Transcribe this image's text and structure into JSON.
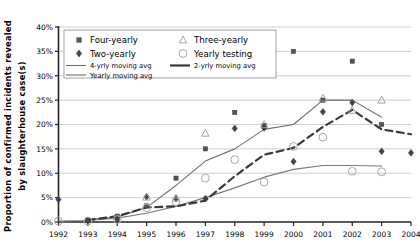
{
  "chart_data": {
    "type": "line",
    "title": "",
    "xlabel": "",
    "ylabel": "Proportion of confirmed incidents revealed by slaughterhouse case(s)",
    "ylabel_line1": "Proportion  of  confirmed  incidents  revealed",
    "ylabel_line2": "by  slaughterhouse  case(s)",
    "x": [
      1992,
      1993,
      1994,
      1995,
      1996,
      1997,
      1998,
      1999,
      2000,
      2001,
      2002,
      2003,
      2004
    ],
    "xticklabels": [
      "1992",
      "1993",
      "1994",
      "1995",
      "1996",
      "1997",
      "1998",
      "1999",
      "2000",
      "2001",
      "2002",
      "2003",
      "2004"
    ],
    "yticklabels": [
      "0%",
      "5%",
      "10%",
      "15%",
      "20%",
      "25%",
      "30%",
      "35%",
      "40%"
    ],
    "yticks": [
      0,
      5,
      10,
      15,
      20,
      25,
      30,
      35,
      40
    ],
    "ylim": [
      0,
      40
    ],
    "xlim": [
      1992,
      2004
    ],
    "grid": true,
    "grid_axis": "y",
    "legend_position": "top-left-inside",
    "series": [
      {
        "name": "Four-yearly",
        "key": "four_yearly",
        "marker": "square",
        "style": "markers",
        "color": "#555555",
        "points": [
          {
            "x": 1993,
            "y": 0.4
          },
          {
            "x": 1994,
            "y": 1.2
          },
          {
            "x": 1995,
            "y": 3.3
          },
          {
            "x": 1996,
            "y": 9.0
          },
          {
            "x": 1997,
            "y": 15.0
          },
          {
            "x": 1998,
            "y": 22.5
          },
          {
            "x": 1999,
            "y": 19.8
          },
          {
            "x": 2000,
            "y": 35.0
          },
          {
            "x": 2001,
            "y": 25.0
          },
          {
            "x": 2002,
            "y": 33.0
          },
          {
            "x": 2003,
            "y": 20.0
          }
        ]
      },
      {
        "name": "Two-yearly",
        "key": "two_yearly",
        "marker": "diamond",
        "style": "markers",
        "color": "#444444",
        "points": [
          {
            "x": 1992,
            "y": 4.6
          },
          {
            "x": 1993,
            "y": 0.3
          },
          {
            "x": 1994,
            "y": 0.5
          },
          {
            "x": 1995,
            "y": 5.2
          },
          {
            "x": 1996,
            "y": 4.8
          },
          {
            "x": 1997,
            "y": 4.8
          },
          {
            "x": 1998,
            "y": 19.2
          },
          {
            "x": 1999,
            "y": 19.3
          },
          {
            "x": 2000,
            "y": 12.4
          },
          {
            "x": 2001,
            "y": 22.6
          },
          {
            "x": 2002,
            "y": 24.5
          },
          {
            "x": 2003,
            "y": 14.5
          },
          {
            "x": 2004,
            "y": 14.2
          }
        ]
      },
      {
        "name": "Three-yearly",
        "key": "three_yearly",
        "marker": "triangle",
        "style": "markers",
        "color": "#9a9a9a",
        "points": [
          {
            "x": 1995,
            "y": 5.1
          },
          {
            "x": 1996,
            "y": 4.9
          },
          {
            "x": 1997,
            "y": 18.2
          },
          {
            "x": 1999,
            "y": 20.0
          },
          {
            "x": 2001,
            "y": 25.4
          },
          {
            "x": 2002,
            "y": 22.9
          },
          {
            "x": 2003,
            "y": 25.0
          }
        ]
      },
      {
        "name": "Yearly testing",
        "key": "yearly_testing",
        "marker": "circle",
        "style": "markers",
        "color": "#a8a8a8",
        "points": [
          {
            "x": 1992,
            "y": 0.2
          },
          {
            "x": 1993,
            "y": 0.2
          },
          {
            "x": 1994,
            "y": 0.5
          },
          {
            "x": 1995,
            "y": 2.9
          },
          {
            "x": 1996,
            "y": 4.2
          },
          {
            "x": 1997,
            "y": 9.0
          },
          {
            "x": 1998,
            "y": 12.8
          },
          {
            "x": 1999,
            "y": 8.2
          },
          {
            "x": 2000,
            "y": 15.5
          },
          {
            "x": 2001,
            "y": 17.4
          },
          {
            "x": 2002,
            "y": 10.4
          },
          {
            "x": 2003,
            "y": 10.3
          }
        ]
      },
      {
        "name": "4-yrly moving avg",
        "key": "ma4",
        "style": "line",
        "linestyle": "solid",
        "width": 1.1,
        "color": "#6e6e6e",
        "points": [
          {
            "x": 1993,
            "y": 0.5
          },
          {
            "x": 1994,
            "y": 1.0
          },
          {
            "x": 1995,
            "y": 3.0
          },
          {
            "x": 1996,
            "y": 7.5
          },
          {
            "x": 1997,
            "y": 12.5
          },
          {
            "x": 1998,
            "y": 15.0
          },
          {
            "x": 1999,
            "y": 19.0
          },
          {
            "x": 2000,
            "y": 20.0
          },
          {
            "x": 2001,
            "y": 25.0
          },
          {
            "x": 2002,
            "y": 25.0
          },
          {
            "x": 2003,
            "y": 21.5
          }
        ]
      },
      {
        "name": "Yearly moving avg",
        "key": "ma1",
        "style": "line",
        "linestyle": "solid",
        "width": 1.1,
        "color": "#7a7a7a",
        "points": [
          {
            "x": 1992,
            "y": 0.2
          },
          {
            "x": 1993,
            "y": 0.3
          },
          {
            "x": 1994,
            "y": 0.8
          },
          {
            "x": 1995,
            "y": 1.8
          },
          {
            "x": 1996,
            "y": 3.2
          },
          {
            "x": 1997,
            "y": 5.0
          },
          {
            "x": 1998,
            "y": 7.0
          },
          {
            "x": 1999,
            "y": 9.2
          },
          {
            "x": 2000,
            "y": 10.8
          },
          {
            "x": 2001,
            "y": 11.6
          },
          {
            "x": 2002,
            "y": 11.6
          },
          {
            "x": 2003,
            "y": 11.5
          }
        ]
      },
      {
        "name": "2-yrly moving avg",
        "key": "ma2",
        "style": "line",
        "linestyle": "dashed",
        "width": 2.2,
        "color": "#3a3a3a",
        "points": [
          {
            "x": 1993,
            "y": 0.4
          },
          {
            "x": 1994,
            "y": 1.2
          },
          {
            "x": 1995,
            "y": 3.0
          },
          {
            "x": 1996,
            "y": 3.2
          },
          {
            "x": 1997,
            "y": 4.4
          },
          {
            "x": 1998,
            "y": 9.4
          },
          {
            "x": 1999,
            "y": 13.8
          },
          {
            "x": 2000,
            "y": 15.2
          },
          {
            "x": 2001,
            "y": 19.5
          },
          {
            "x": 2002,
            "y": 23.0
          },
          {
            "x": 2003,
            "y": 19.0
          },
          {
            "x": 2004,
            "y": 18.0
          }
        ]
      }
    ],
    "legend": [
      {
        "label": "Four-yearly",
        "glyph": "square",
        "size": "large"
      },
      {
        "label": "Two-yearly",
        "glyph": "diamond",
        "size": "large"
      },
      {
        "label": "4-yrly moving avg",
        "glyph": "line-solid",
        "size": "small"
      },
      {
        "label": "Yearly moving avg",
        "glyph": "line-solid",
        "size": "small"
      },
      {
        "label": "Three-yearly",
        "glyph": "triangle",
        "size": "large"
      },
      {
        "label": "Yearly testing",
        "glyph": "circle",
        "size": "large"
      },
      {
        "label": "2-yrly moving avg",
        "glyph": "line-dashed",
        "size": "small"
      }
    ],
    "colors": {
      "grid": "#c9c9c9",
      "axis": "#222222",
      "background": "#ffffff",
      "dark_marker": "#555555",
      "light_marker": "#a8a8a8",
      "dashed_line": "#3a3a3a"
    }
  }
}
